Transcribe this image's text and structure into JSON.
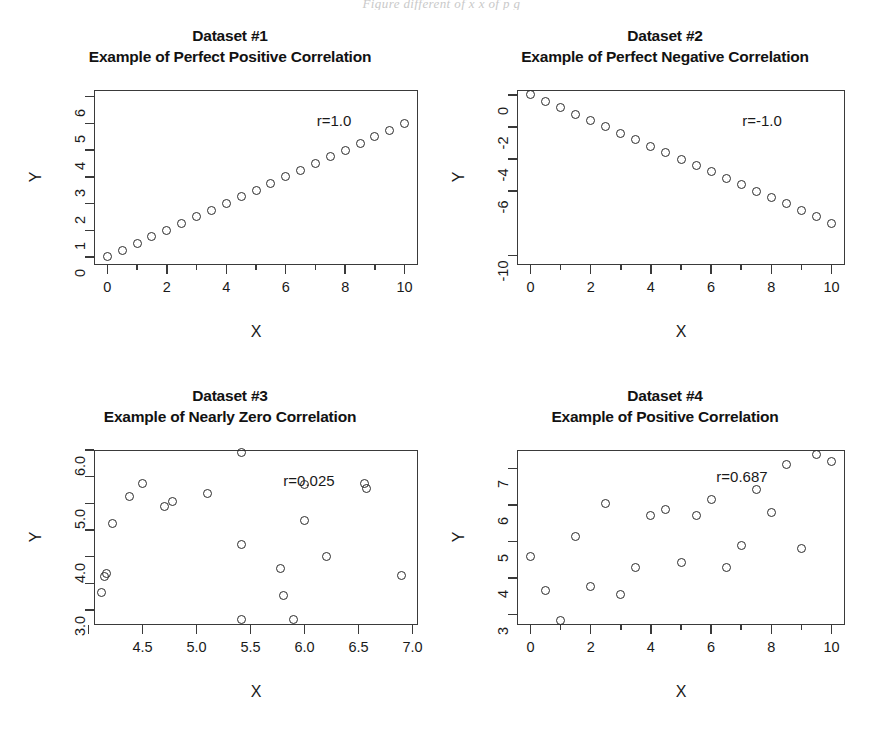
{
  "page": {
    "caption_fragment": "Figure   different   of   x   x   of   p   g"
  },
  "axis": {
    "x_title": "X",
    "y_title": "Y"
  },
  "chart_data": [
    {
      "type": "scatter",
      "panel": 1,
      "title": "Dataset #1",
      "subtitle": "Example of Perfect Positive Correlation",
      "annotation": "r=1.0",
      "r": 1.0,
      "xlabel": "X",
      "ylabel": "Y",
      "xlim": [
        -0.45,
        10.45
      ],
      "ylim": [
        -0.3,
        6.25
      ],
      "xticks": [
        0,
        2,
        4,
        6,
        8,
        10
      ],
      "xtick_labels": [
        "0",
        "2",
        "4",
        "6",
        "8",
        "10"
      ],
      "xminor_ticks": [
        1,
        3,
        5,
        7,
        9
      ],
      "yticks": [
        0,
        1,
        2,
        3,
        4,
        5,
        6
      ],
      "ytick_labels": [
        "0",
        "1",
        "2",
        "3",
        "4",
        "5",
        "6"
      ],
      "grid": false,
      "x": [
        0,
        0.5,
        1,
        1.5,
        2,
        2.5,
        3,
        3.5,
        4,
        4.5,
        5,
        5.5,
        6,
        6.5,
        7,
        7.5,
        8,
        8.5,
        9,
        9.5,
        10
      ],
      "y": [
        0,
        0.25,
        0.5,
        0.75,
        1.0,
        1.25,
        1.5,
        1.75,
        2.0,
        2.25,
        2.5,
        2.75,
        3.0,
        3.25,
        3.5,
        3.75,
        4.0,
        4.25,
        4.5,
        4.75,
        5.0
      ]
    },
    {
      "type": "scatter",
      "panel": 2,
      "title": "Dataset #2",
      "subtitle": "Example of Perfect Negative Correlation",
      "annotation": "r=-1.0",
      "r": -1.0,
      "xlabel": "X",
      "ylabel": "Y",
      "xlim": [
        -0.45,
        10.45
      ],
      "ylim": [
        -10.6,
        0.3
      ],
      "xticks": [
        0,
        2,
        4,
        6,
        8,
        10
      ],
      "xtick_labels": [
        "0",
        "2",
        "4",
        "6",
        "8",
        "10"
      ],
      "xminor_ticks": [
        1,
        3,
        5,
        7,
        9
      ],
      "yticks": [
        0,
        -2,
        -4,
        -6,
        -10
      ],
      "ytick_labels": [
        "0",
        "-2",
        "-4",
        "-6",
        "-10"
      ],
      "grid": false,
      "x": [
        0,
        0.5,
        1,
        1.5,
        2,
        2.5,
        3,
        3.5,
        4,
        4.5,
        5,
        5.5,
        6,
        6.5,
        7,
        7.5,
        8,
        8.5,
        9,
        9.5,
        10
      ],
      "y": [
        0,
        -0.4,
        -0.8,
        -1.2,
        -1.6,
        -2.0,
        -2.4,
        -2.8,
        -3.2,
        -3.6,
        -4.0,
        -4.4,
        -4.8,
        -5.2,
        -5.6,
        -6.0,
        -6.4,
        -6.8,
        -7.2,
        -7.6,
        -8.0
      ]
    },
    {
      "type": "scatter",
      "panel": 3,
      "title": "Dataset #3",
      "subtitle": "Example of Nearly Zero Correlation",
      "annotation": "r=0.025",
      "r": 0.025,
      "xlabel": "X",
      "ylabel": "Y",
      "xlim": [
        4.05,
        7.05
      ],
      "ylim": [
        2.72,
        6.0
      ],
      "xticks": [
        4.0,
        4.5,
        5.0,
        5.5,
        6.0,
        6.5,
        7.0
      ],
      "xtick_labels": [
        "",
        "4.5",
        "5.0",
        "5.5",
        "6.0",
        "6.5",
        "7.0"
      ],
      "yticks": [
        3.0,
        3.5,
        4.0,
        4.5,
        5.0,
        5.5,
        6.0
      ],
      "ytick_labels": [
        "3.0",
        "",
        "4.0",
        "",
        "5.0",
        "",
        "6.0"
      ],
      "grid": false,
      "x": [
        4.12,
        4.15,
        4.17,
        4.22,
        4.38,
        4.5,
        4.7,
        4.78,
        5.1,
        5.42,
        5.42,
        5.42,
        5.78,
        5.8,
        5.9,
        6.0,
        6.0,
        6.2,
        6.55,
        6.57,
        6.9
      ],
      "y": [
        3.32,
        3.62,
        3.68,
        4.62,
        5.12,
        5.38,
        4.95,
        5.03,
        5.18,
        5.95,
        4.22,
        2.82,
        3.78,
        3.28,
        2.83,
        5.35,
        4.68,
        4.0,
        5.38,
        5.28,
        3.65
      ]
    },
    {
      "type": "scatter",
      "panel": 4,
      "title": "Dataset #4",
      "subtitle": "Example of Positive Correlation",
      "annotation": "r=0.687",
      "r": 0.687,
      "xlabel": "X",
      "ylabel": "Y",
      "xlim": [
        -0.45,
        10.45
      ],
      "ylim": [
        2.72,
        7.5
      ],
      "xticks": [
        0,
        2,
        4,
        6,
        8,
        10
      ],
      "xtick_labels": [
        "0",
        "2",
        "4",
        "6",
        "8",
        "10"
      ],
      "xminor_ticks": [
        1,
        3,
        5,
        7,
        9
      ],
      "yticks": [
        3,
        4,
        5,
        6,
        7
      ],
      "ytick_labels": [
        "3",
        "4",
        "5",
        "6",
        "7"
      ],
      "grid": false,
      "x": [
        0,
        0.5,
        1,
        1.5,
        2,
        2.5,
        3,
        3.5,
        4,
        4.5,
        5,
        5.5,
        6,
        6.5,
        7,
        7.5,
        8,
        8.5,
        9,
        9.5,
        10
      ],
      "y": [
        4.6,
        3.65,
        2.85,
        5.15,
        3.78,
        6.05,
        3.55,
        4.3,
        5.72,
        5.88,
        4.42,
        5.7,
        6.15,
        4.28,
        4.88,
        6.42,
        5.8,
        7.1,
        4.82,
        7.38,
        7.18
      ]
    }
  ]
}
